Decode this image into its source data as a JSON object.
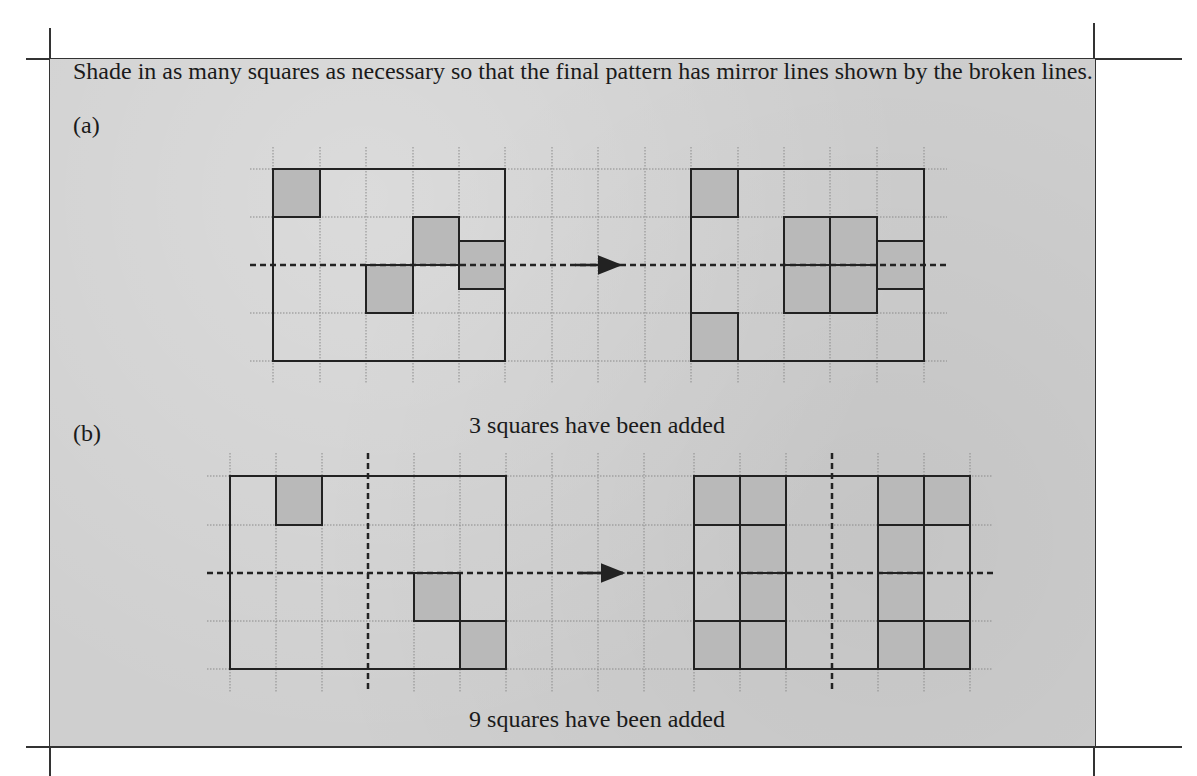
{
  "page": {
    "cutoff_text": "Engagement to Engage"
  },
  "exercise": {
    "instruction": "Shade in as many squares as necessary so that the final pattern has mirror lines shown by the broken lines.",
    "parts": [
      {
        "label": "(a)",
        "caption": "3 squares have been added",
        "mirror_lines": [
          "horizontal"
        ],
        "grid": {
          "columns": 5,
          "rows": 4
        },
        "original_shaded": [
          {
            "col": 0,
            "row": 0
          },
          {
            "col": 3,
            "row": 1
          },
          {
            "col": 2,
            "row": 2
          },
          {
            "col": 4,
            "row": 1.5
          }
        ],
        "result_shaded": [
          {
            "col": 0,
            "row": 0
          },
          {
            "col": 0,
            "row": 3
          },
          {
            "col": 2,
            "row": 1
          },
          {
            "col": 3,
            "row": 1
          },
          {
            "col": 2,
            "row": 2
          },
          {
            "col": 3,
            "row": 2
          },
          {
            "col": 4,
            "row": 1.5
          }
        ],
        "squares_added": 3
      },
      {
        "label": "(b)",
        "caption": "9 squares have been added",
        "mirror_lines": [
          "horizontal",
          "vertical"
        ],
        "grid": {
          "columns": 6,
          "rows": 4
        },
        "original_shaded": [
          {
            "col": 1,
            "row": 0
          },
          {
            "col": 4,
            "row": 2
          },
          {
            "col": 5,
            "row": 3
          }
        ],
        "result_shaded": [
          {
            "col": 0,
            "row": 0
          },
          {
            "col": 1,
            "row": 0
          },
          {
            "col": 4,
            "row": 0
          },
          {
            "col": 5,
            "row": 0
          },
          {
            "col": 1,
            "row": 1
          },
          {
            "col": 4,
            "row": 1
          },
          {
            "col": 1,
            "row": 2
          },
          {
            "col": 4,
            "row": 2
          },
          {
            "col": 0,
            "row": 3
          },
          {
            "col": 1,
            "row": 3
          },
          {
            "col": 4,
            "row": 3
          },
          {
            "col": 5,
            "row": 3
          }
        ],
        "squares_added": 9
      }
    ]
  },
  "colors": {
    "panel_bg": "#cfcfcf",
    "shaded_cell": "#b9b9b9",
    "grid_line": "#8a8a8a",
    "outline": "#222222"
  }
}
